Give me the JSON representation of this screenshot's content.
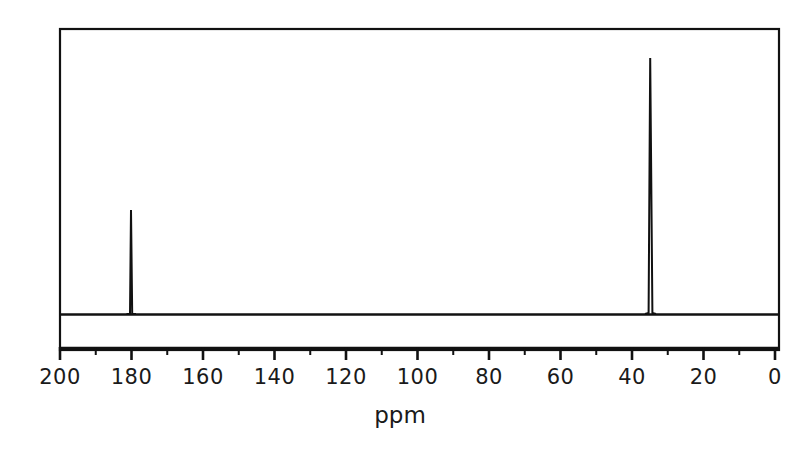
{
  "figure": {
    "background_color": "#ffffff",
    "line_color": "#111111",
    "axis_title": "ppm"
  },
  "chart_data": {
    "type": "line",
    "title": "",
    "subtitle": "",
    "xlabel": "ppm",
    "ylabel": "",
    "xlim": [
      200,
      0
    ],
    "ylim": [
      0,
      100
    ],
    "x_axis_inverted": true,
    "grid": false,
    "legend": null,
    "major_tick_interval": 20,
    "minor_tick_interval": 10,
    "tick_labels": [
      "200",
      "180",
      "160",
      "140",
      "120",
      "100",
      "80",
      "60",
      "40",
      "20",
      "0"
    ],
    "major_ticks": [
      200,
      180,
      160,
      140,
      120,
      100,
      80,
      60,
      40,
      20,
      0
    ],
    "minor_ticks": [
      190,
      170,
      150,
      130,
      110,
      90,
      70,
      50,
      30,
      10
    ],
    "baseline_value": 0,
    "peaks": [
      {
        "label": "carbonyl-peak",
        "ppm": 180,
        "intensity": 30,
        "width_ppm": 0.5
      },
      {
        "label": "aliphatic-peak",
        "ppm": 34.7,
        "intensity": 90,
        "width_ppm": 0.7
      }
    ],
    "series": [
      {
        "name": "13C NMR spectrum",
        "x": [
          200,
          181.2,
          180.6,
          180.0,
          179.4,
          178.8,
          60,
          36.2,
          35.4,
          34.7,
          34.0,
          33.2,
          10,
          0
        ],
        "values": [
          0,
          0,
          1,
          30,
          1,
          0,
          0,
          0,
          1,
          90,
          1,
          0,
          0,
          0
        ]
      }
    ]
  }
}
